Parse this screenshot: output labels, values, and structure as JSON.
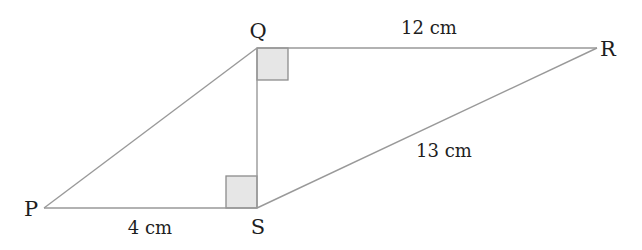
{
  "figure": {
    "type": "geometry-diagram",
    "colors": {
      "line": "#999999",
      "text": "#1e1e1e",
      "right_angle_fill": "#e6e6e6",
      "right_angle_stroke": "#8c8c8c"
    },
    "points": {
      "P": {
        "label": "P",
        "x": 44,
        "y": 208
      },
      "Q": {
        "label": "Q",
        "x": 257,
        "y": 48
      },
      "R": {
        "label": "R",
        "x": 597,
        "y": 48
      },
      "S": {
        "label": "S",
        "x": 257,
        "y": 208
      }
    },
    "segments": [
      {
        "from": "P",
        "to": "Q"
      },
      {
        "from": "Q",
        "to": "R"
      },
      {
        "from": "R",
        "to": "S"
      },
      {
        "from": "S",
        "to": "P"
      },
      {
        "from": "Q",
        "to": "S"
      }
    ],
    "measurements": {
      "QR": "12 cm",
      "RS": "13 cm",
      "PS": "4 cm"
    },
    "right_angles": [
      "PQR at Q (angle SQR)",
      "PSQ at S"
    ]
  }
}
